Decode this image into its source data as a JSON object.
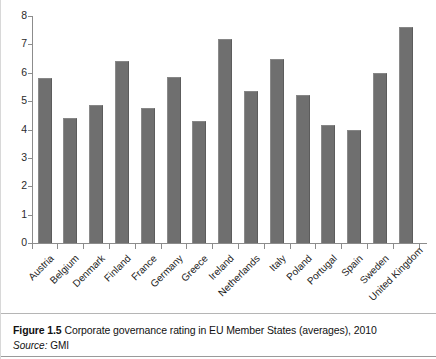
{
  "figure": {
    "caption_number": "Figure 1.5",
    "caption_text": "Corporate governance rating in EU Member States (averages), 2010",
    "source_label": "Source:",
    "source_value": "GMI"
  },
  "chart_data": {
    "type": "bar",
    "title": "Corporate governance rating in EU Member States (averages), 2010",
    "xlabel": "",
    "ylabel": "",
    "ylim": [
      0,
      8
    ],
    "yticks": [
      0,
      1,
      2,
      3,
      4,
      5,
      6,
      7,
      8
    ],
    "ytick_labels": [
      "0",
      "1",
      "2",
      "3",
      "4",
      "5",
      "6",
      "7",
      "8"
    ],
    "grid": false,
    "legend": "none",
    "bar_color": "#6f6f6f",
    "axis_color": "#8c8c8c",
    "categories": [
      "Austria",
      "Belgium",
      "Denmark",
      "Finland",
      "France",
      "Germany",
      "Greece",
      "Ireland",
      "Netherlands",
      "Italy",
      "Poland",
      "Portugal",
      "Spain",
      "Sweden",
      "United Kingdom"
    ],
    "values": [
      5.8,
      4.4,
      4.85,
      6.4,
      4.75,
      5.85,
      4.3,
      7.2,
      5.35,
      6.5,
      5.2,
      4.15,
      4.0,
      6.0,
      7.6
    ]
  }
}
